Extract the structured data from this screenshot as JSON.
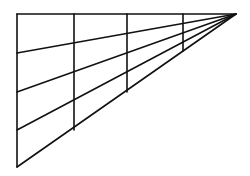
{
  "diagram": {
    "type": "perspective-grid",
    "background": "#ffffff",
    "stroke_color": "#111111",
    "apex": {
      "x": 236,
      "y": 14
    },
    "left_edge_x": 17,
    "top_y": 14,
    "left_edge_points_y": [
      14,
      53,
      92,
      130,
      167
    ],
    "verticals": [
      {
        "x": 17,
        "y1": 14,
        "y2": 167
      },
      {
        "x": 74,
        "y1": 14,
        "y2": 130
      },
      {
        "x": 127,
        "y1": 14,
        "y2": 92
      },
      {
        "x": 183,
        "y1": 14,
        "y2": 51
      }
    ]
  }
}
